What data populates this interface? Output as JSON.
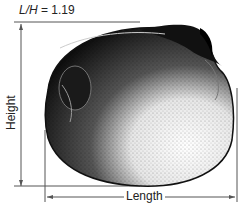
{
  "figure": {
    "ratio_label_var": "L/H",
    "ratio_label_eq": " = 1.19",
    "height_label": "Height",
    "length_label": "Length"
  },
  "colors": {
    "line": "#555555",
    "shell_dark": "#111111",
    "shell_light": "#f2f2f2"
  }
}
